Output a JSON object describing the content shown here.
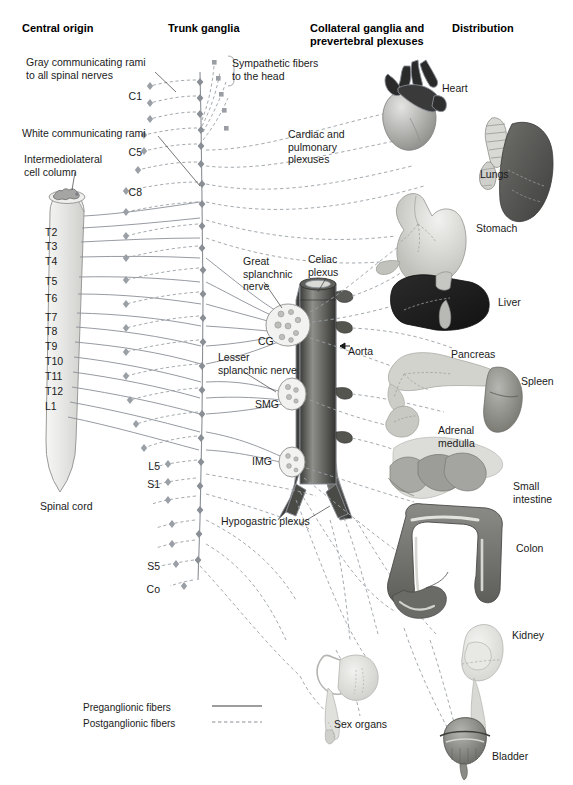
{
  "figure": {
    "type": "anatomical-diagram"
  },
  "columns": [
    {
      "id": "central-origin",
      "title": "Central origin",
      "x": 22,
      "y": 22
    },
    {
      "id": "trunk-ganglia",
      "title": "Trunk ganglia",
      "x": 168,
      "y": 22
    },
    {
      "id": "collateral-ganglia",
      "title": "Collateral ganglia and\nprevertebral plexuses",
      "x": 310,
      "y": 22
    },
    {
      "id": "distribution",
      "title": "Distribution",
      "x": 452,
      "y": 22
    }
  ],
  "annotations": [
    {
      "id": "gray-rami",
      "text": "Gray communicating rami\nto all spinal nerves",
      "x": 26,
      "y": 56
    },
    {
      "id": "white-rami",
      "text": "White communicating rami",
      "x": 22,
      "y": 127
    },
    {
      "id": "iml-column",
      "text": "Intermediolateral\ncell column",
      "x": 24,
      "y": 153
    },
    {
      "id": "sympathetic-head",
      "text": "Sympathetic fibers\nto the head",
      "x": 232,
      "y": 57
    },
    {
      "id": "cardiac-pulmonary",
      "text": "Cardiac and\npulmonary\nplexuses",
      "x": 288,
      "y": 128
    },
    {
      "id": "great-splanchnic",
      "text": "Great\nsplanchnic\nnerve",
      "x": 243,
      "y": 255
    },
    {
      "id": "celiac-plexus",
      "text": "Celiac\nplexus",
      "x": 308,
      "y": 253
    },
    {
      "id": "lesser-splanchnic",
      "text": "Lesser\nsplanchnic nerve",
      "x": 218,
      "y": 351
    },
    {
      "id": "aorta",
      "text": "Aorta",
      "x": 348,
      "y": 345
    },
    {
      "id": "hypogastric-plexus",
      "text": "Hypogastric plexus",
      "x": 221,
      "y": 515
    },
    {
      "id": "spinal-cord",
      "text": "Spinal cord",
      "x": 40,
      "y": 500
    }
  ],
  "spinal_segments": [
    {
      "label": "C1",
      "x": 142,
      "y": 90,
      "align": "right"
    },
    {
      "label": "C5",
      "x": 142,
      "y": 146,
      "align": "right"
    },
    {
      "label": "C8",
      "x": 142,
      "y": 186,
      "align": "right"
    },
    {
      "label": "T2",
      "x": 45,
      "y": 226,
      "align": "left"
    },
    {
      "label": "T3",
      "x": 45,
      "y": 240,
      "align": "left"
    },
    {
      "label": "T4",
      "x": 45,
      "y": 255,
      "align": "left"
    },
    {
      "label": "T5",
      "x": 45,
      "y": 275,
      "align": "left"
    },
    {
      "label": "T6",
      "x": 45,
      "y": 292,
      "align": "left"
    },
    {
      "label": "T7",
      "x": 45,
      "y": 311,
      "align": "left"
    },
    {
      "label": "T8",
      "x": 45,
      "y": 325,
      "align": "left"
    },
    {
      "label": "T9",
      "x": 45,
      "y": 340,
      "align": "left"
    },
    {
      "label": "T10",
      "x": 45,
      "y": 355,
      "align": "left"
    },
    {
      "label": "T11",
      "x": 45,
      "y": 370,
      "align": "left"
    },
    {
      "label": "T12",
      "x": 45,
      "y": 385,
      "align": "left"
    },
    {
      "label": "L1",
      "x": 45,
      "y": 400,
      "align": "left"
    },
    {
      "label": "L5",
      "x": 160,
      "y": 460,
      "align": "right"
    },
    {
      "label": "S1",
      "x": 160,
      "y": 478,
      "align": "right"
    },
    {
      "label": "S5",
      "x": 160,
      "y": 560,
      "align": "right"
    },
    {
      "label": "Co",
      "x": 160,
      "y": 583,
      "align": "right"
    }
  ],
  "collateral_ganglia": [
    {
      "id": "cg",
      "label": "CG",
      "x": 258,
      "y": 335
    },
    {
      "id": "smg",
      "label": "SMG",
      "x": 255,
      "y": 398
    },
    {
      "id": "img",
      "label": "IMG",
      "x": 252,
      "y": 455
    }
  ],
  "organs": [
    {
      "id": "heart",
      "label": "Heart",
      "x": 442,
      "y": 82
    },
    {
      "id": "lungs",
      "label": "Lungs",
      "x": 480,
      "y": 168
    },
    {
      "id": "stomach",
      "label": "Stomach",
      "x": 476,
      "y": 222
    },
    {
      "id": "liver",
      "label": "Liver",
      "x": 498,
      "y": 296
    },
    {
      "id": "pancreas",
      "label": "Pancreas",
      "x": 451,
      "y": 348
    },
    {
      "id": "spleen",
      "label": "Spleen",
      "x": 521,
      "y": 375
    },
    {
      "id": "adrenal-medulla",
      "label": "Adrenal\nmedulla",
      "x": 438,
      "y": 424
    },
    {
      "id": "small-intestine",
      "label": "Small\nintestine",
      "x": 513,
      "y": 480
    },
    {
      "id": "colon",
      "label": "Colon",
      "x": 516,
      "y": 542
    },
    {
      "id": "kidney",
      "label": "Kidney",
      "x": 512,
      "y": 629
    },
    {
      "id": "sex-organs",
      "label": "Sex organs",
      "x": 334,
      "y": 718
    },
    {
      "id": "bladder",
      "label": "Bladder",
      "x": 492,
      "y": 750
    }
  ],
  "legend": {
    "items": [
      {
        "id": "preganglionic",
        "label": "Preganglionic fibers",
        "style": "solid"
      },
      {
        "id": "postganglionic",
        "label": "Postganglionic fibers",
        "style": "dashed"
      }
    ],
    "x": 83,
    "y": 702
  },
  "colors": {
    "fiber": "#8a8f96",
    "cord_fill": "#e3e3e1",
    "cord_edge": "#9a9a98",
    "gray_matter": "#a5a5a3",
    "aorta_dark": "#4e4e4c",
    "aorta_light": "#8d8d8a",
    "ganglion_fill": "#f0f0ee",
    "heart_dark": "#2e2e2e",
    "heart_light": "#b9b9b7",
    "lung_dark": "#5b5b59",
    "stomach": "#c9c9c5",
    "liver": "#1f1f1f",
    "pancreas": "#c5c5c0",
    "spleen": "#8e8e8b",
    "intestine": "#9a9a96",
    "colon": "#6f6f6c",
    "kidney": "#dcdcd8",
    "bladder": "#7d7d7a",
    "text": "#1b1b1b"
  }
}
